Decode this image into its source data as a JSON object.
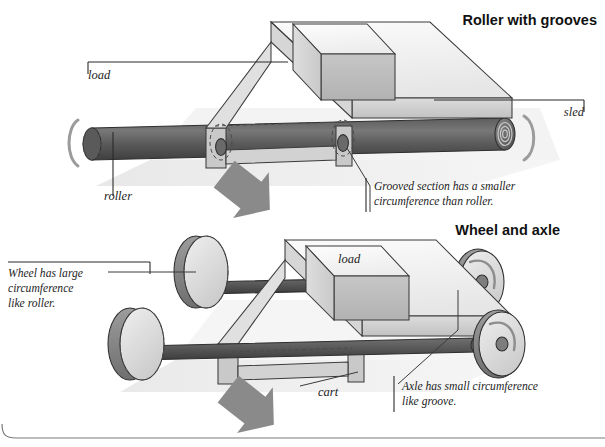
{
  "figure": {
    "background": "#ffffff",
    "ink": "#1d1d1d"
  },
  "sections": [
    {
      "id": "roller",
      "title": "Roller with grooves",
      "labels": [
        {
          "name": "load",
          "text": "load"
        },
        {
          "name": "sled",
          "text": "sled"
        },
        {
          "name": "roller",
          "text": "roller"
        }
      ],
      "annotations": [
        {
          "name": "grooved-section-note",
          "lines": [
            "Grooved section has a smaller",
            "circumference than roller."
          ]
        }
      ]
    },
    {
      "id": "wheel-and-axle",
      "title": "Wheel and axle",
      "labels": [
        {
          "name": "load",
          "text": "load"
        },
        {
          "name": "cart",
          "text": "cart"
        }
      ],
      "annotations": [
        {
          "name": "wheel-circumference-note",
          "lines": [
            "Wheel has large",
            "circumference",
            "like roller."
          ]
        },
        {
          "name": "axle-circumference-note",
          "lines": [
            "Axle has small circumference",
            "like groove."
          ]
        }
      ]
    }
  ],
  "palette": {
    "roller_dark": "#4b4b4b",
    "roller_mid": "#6e6e6e",
    "sled_top": "#f2f2f2",
    "sled_side": "#cfcfcf",
    "load_face": "#bdbdbd",
    "arrow": "#8a8a8a",
    "wheel_face": "#dadada",
    "wheel_rim": "#8f8f8f",
    "shadow": "#e2e2e2"
  }
}
